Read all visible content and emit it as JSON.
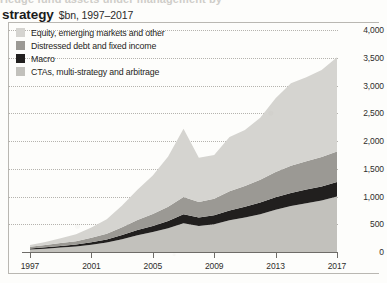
{
  "header": {
    "cropped_line_above": "Hedge fund assets under management by",
    "title_bold": "strategy",
    "title_rest": "$bn, 1997–2017"
  },
  "legend": {
    "items": [
      {
        "label": "Equity, emerging markets and other",
        "color": "#d5d4d0",
        "key": "equity"
      },
      {
        "label": "Distressed debt and fixed income",
        "color": "#9b9994",
        "key": "distressed"
      },
      {
        "label": "Macro",
        "color": "#211f1e",
        "key": "macro"
      },
      {
        "label": "CTAs, multi-strategy and arbitrage",
        "color": "#c2c1bc",
        "key": "ctas"
      }
    ]
  },
  "axes": {
    "y_ticks": [
      "0",
      "500",
      "1,000",
      "1,500",
      "2,000",
      "2,500",
      "3,000",
      "3,500",
      "4,000"
    ],
    "x_ticks": [
      "1997",
      "2001",
      "2005",
      "2009",
      "2013",
      "2017"
    ]
  },
  "chart_data": {
    "type": "area",
    "stacked": true,
    "xlabel": "",
    "ylabel": "$bn",
    "ylim": [
      0,
      4000
    ],
    "xlim": [
      1997,
      2017
    ],
    "ytick_values": [
      0,
      500,
      1000,
      1500,
      2000,
      2500,
      3000,
      3500,
      4000
    ],
    "grid": true,
    "legend_position": "top-left",
    "x": [
      1997,
      1998,
      1999,
      2000,
      2001,
      2002,
      2003,
      2004,
      2005,
      2006,
      2007,
      2008,
      2009,
      2010,
      2011,
      2012,
      2013,
      2014,
      2015,
      2016,
      2017
    ],
    "series": [
      {
        "name": "CTAs, multi-strategy and arbitrage",
        "color": "#c2c1bc",
        "values": [
          45,
          60,
          80,
          100,
          130,
          170,
          230,
          300,
          360,
          430,
          520,
          470,
          500,
          570,
          620,
          680,
          760,
          830,
          880,
          930,
          1000
        ]
      },
      {
        "name": "Macro",
        "color": "#211f1e",
        "values": [
          20,
          25,
          30,
          35,
          45,
          55,
          75,
          95,
          110,
          130,
          160,
          150,
          160,
          180,
          195,
          210,
          225,
          235,
          245,
          250,
          260
        ]
      },
      {
        "name": "Distressed debt and fixed income",
        "color": "#9b9994",
        "values": [
          30,
          40,
          50,
          60,
          80,
          105,
          140,
          180,
          215,
          255,
          310,
          280,
          300,
          345,
          375,
          410,
          455,
          490,
          510,
          530,
          550
        ]
      },
      {
        "name": "Equity, emerging markets and other",
        "color": "#d5d4d0",
        "values": [
          30,
          55,
          90,
          125,
          185,
          260,
          395,
          545,
          695,
          905,
          1230,
          800,
          790,
          975,
          1010,
          1120,
          1330,
          1485,
          1515,
          1570,
          1700
        ]
      }
    ],
    "totals": [
      125,
      180,
      250,
      320,
      440,
      590,
      840,
      1120,
      1380,
      1720,
      2220,
      1700,
      1750,
      2070,
      2200,
      2420,
      2770,
      3040,
      3150,
      3280,
      3510
    ],
    "annotations": [
      {
        "text": "peak before financial crisis",
        "x": 2007,
        "y": 2220
      },
      {
        "text": "trough after financial crisis",
        "x": 2008,
        "y": 1700
      }
    ]
  }
}
